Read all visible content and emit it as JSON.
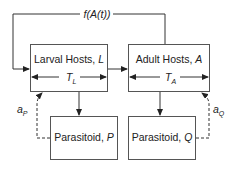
{
  "diagram": {
    "feedback_label": "f(A(t))",
    "boxes": {
      "larval": {
        "label": "Larval Hosts, ",
        "symbol": "L",
        "duration": "T",
        "duration_sub": "L"
      },
      "adult": {
        "label": "Adult Hosts, ",
        "symbol": "A",
        "duration": "T",
        "duration_sub": "A"
      },
      "parasitoid_p": {
        "label": "Parasitoid, ",
        "symbol": "P"
      },
      "parasitoid_q": {
        "label": "Parasitoid, ",
        "symbol": "Q"
      }
    },
    "attack_rates": {
      "p": {
        "base": "a",
        "sub": "P"
      },
      "q": {
        "base": "a",
        "sub": "Q"
      }
    },
    "colors": {
      "line": "#333333",
      "box_border": "#555555",
      "text": "#222222"
    }
  }
}
